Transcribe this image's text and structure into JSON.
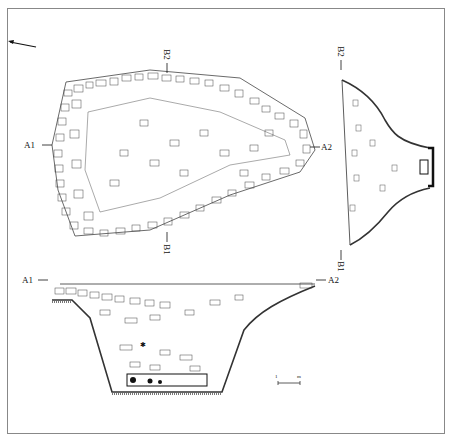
{
  "figure": {
    "type": "archaeological excavation drawing",
    "views": [
      "plan",
      "section A1-A2",
      "section B1-B2"
    ]
  },
  "labels": {
    "plan_a1": "A1",
    "plan_a2": "A2",
    "plan_b1": "B1",
    "plan_b2": "B2",
    "section_b_top": "B2",
    "section_b_bottom": "B1",
    "section_a_left": "A1",
    "section_a_right": "A2"
  },
  "north_arrow": {
    "icon": "north-arrow-icon"
  },
  "scale_bar": {
    "left_tick": "1",
    "right_tick": "m"
  }
}
